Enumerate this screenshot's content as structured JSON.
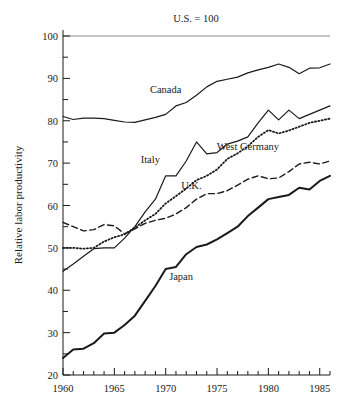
{
  "chart_data": {
    "type": "line",
    "title": "",
    "annotation": "U.S. = 100",
    "ylabel": "Relative labor productivity",
    "xlabel": "",
    "xlim": [
      1960,
      1986
    ],
    "ylim": [
      20,
      100
    ],
    "y_ticks_major": [
      20,
      30,
      40,
      50,
      60,
      70,
      80,
      90,
      100
    ],
    "y_ticks_minor": [
      25,
      35,
      45,
      55,
      65,
      75,
      85,
      95
    ],
    "x_ticks_major": [
      1960,
      1965,
      1970,
      1975,
      1980,
      1985
    ],
    "x_tick_labels": [
      "1960",
      "1965",
      "1970",
      "1975",
      "1980",
      "1985"
    ],
    "y_tick_labels": [
      "20",
      "30",
      "40",
      "50",
      "60",
      "70",
      "80",
      "90",
      "100"
    ],
    "grid": false,
    "legend": "inline-labels",
    "reference_line": {
      "value": 100,
      "label": "U.S. = 100",
      "color": "#777777"
    },
    "x": [
      1960,
      1961,
      1962,
      1963,
      1964,
      1965,
      1966,
      1967,
      1968,
      1969,
      1970,
      1971,
      1972,
      1973,
      1974,
      1975,
      1976,
      1977,
      1978,
      1979,
      1980,
      1981,
      1982,
      1983,
      1984,
      1985,
      1986
    ],
    "series": [
      {
        "name": "Canada",
        "style": "solid",
        "color": "#1a1a1a",
        "label_x": 1970,
        "label_y": 86.5,
        "values": [
          81.0,
          80.3,
          80.6,
          80.6,
          80.5,
          80.1,
          79.7,
          79.6,
          80.2,
          80.8,
          81.5,
          83.5,
          84.3,
          86.0,
          88.0,
          89.3,
          89.8,
          90.3,
          91.3,
          92.0,
          92.6,
          93.4,
          92.6,
          91.1,
          92.4,
          92.5,
          93.4
        ]
      },
      {
        "name": "Italy",
        "style": "solid",
        "color": "#1a1a1a",
        "label_x": 1968.5,
        "label_y": 70.0,
        "values": [
          44.5,
          46.2,
          48.0,
          49.8,
          50.0,
          50.0,
          52.3,
          55.0,
          58.5,
          61.5,
          67.0,
          67.0,
          70.5,
          75.0,
          72.2,
          72.5,
          74.5,
          75.2,
          76.2,
          79.5,
          82.5,
          80.2,
          82.5,
          80.5,
          81.5,
          82.5,
          83.5
        ]
      },
      {
        "name": "West Germany",
        "style": "dotted",
        "color": "#1a1a1a",
        "label_x": 1978,
        "label_y": 73.0,
        "values": [
          50.0,
          50.0,
          49.8,
          50.0,
          51.5,
          52.5,
          53.2,
          54.8,
          56.5,
          58.0,
          60.5,
          62.2,
          64.0,
          66.0,
          67.0,
          68.5,
          71.0,
          72.3,
          74.0,
          76.2,
          77.8,
          77.0,
          77.7,
          78.6,
          79.5,
          80.0,
          80.5
        ]
      },
      {
        "name": "U.K.",
        "style": "dashed",
        "color": "#1a1a1a",
        "label_x": 1972.5,
        "label_y": 64.0,
        "values": [
          56.0,
          55.0,
          54.0,
          54.3,
          55.5,
          55.2,
          53.3,
          54.5,
          55.8,
          56.5,
          57.0,
          58.0,
          59.5,
          61.5,
          62.8,
          62.8,
          63.5,
          64.8,
          66.2,
          67.0,
          66.3,
          66.5,
          68.0,
          69.8,
          70.2,
          69.8,
          70.5
        ]
      },
      {
        "name": "Japan",
        "style": "solid-thick",
        "color": "#1a1a1a",
        "label_x": 1971.5,
        "label_y": 42.5,
        "values": [
          24.0,
          26.0,
          26.2,
          27.5,
          29.8,
          30.0,
          31.8,
          34.0,
          37.5,
          41.0,
          45.0,
          45.5,
          48.5,
          50.2,
          50.8,
          52.0,
          53.5,
          55.0,
          57.5,
          59.5,
          61.5,
          62.0,
          62.5,
          64.2,
          63.8,
          65.8,
          67.0
        ]
      }
    ]
  },
  "axis": {
    "y_title": "Relative labor productivity"
  }
}
